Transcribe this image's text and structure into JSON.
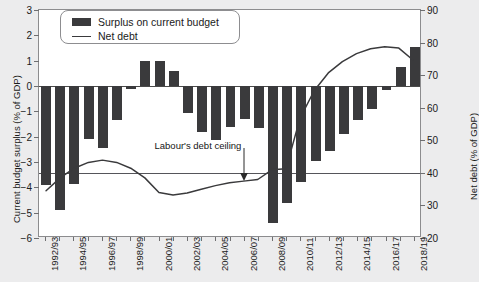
{
  "chart_data": {
    "type": "bar",
    "title": "",
    "categories": [
      "1992/93",
      "1993/94",
      "1994/95",
      "1995/96",
      "1996/97",
      "1997/98",
      "1998/99",
      "1999/00",
      "2000/01",
      "2001/02",
      "2002/03",
      "2003/04",
      "2004/05",
      "2005/06",
      "2006/07",
      "2007/08",
      "2008/09",
      "2009/10",
      "2010/11",
      "2011/12",
      "2012/13",
      "2013/14",
      "2014/15",
      "2015/16",
      "2016/17",
      "2017/18",
      "2018/19"
    ],
    "tick_labels": [
      "1992/93",
      "1994/95",
      "1996/97",
      "1998/99",
      "2000/01",
      "2002/03",
      "2004/05",
      "2006/07",
      "2008/09",
      "2010/11",
      "2012/13",
      "2014/15",
      "2016/17",
      "2018/19"
    ],
    "series": [
      {
        "name": "Surplus on current budget",
        "type": "bar",
        "axis": "left",
        "color": "#3a3a3c",
        "values": [
          -3.9,
          -4.9,
          -3.85,
          -2.1,
          -2.45,
          -1.35,
          -0.1,
          1.0,
          1.0,
          0.6,
          -1.05,
          -1.8,
          -2.15,
          -1.6,
          -1.3,
          -1.65,
          -5.4,
          -4.6,
          -3.8,
          -2.95,
          -2.55,
          -1.9,
          -1.35,
          -0.9,
          -0.15,
          0.75,
          1.55
        ]
      },
      {
        "name": "Net debt",
        "type": "line",
        "axis": "right",
        "color": "#3a3a3c",
        "values": [
          34.0,
          38.0,
          41.0,
          42.8,
          43.5,
          42.8,
          41.0,
          38.0,
          33.5,
          32.7,
          33.3,
          34.5,
          35.6,
          36.5,
          37.0,
          37.5,
          40.5,
          40.8,
          56.5,
          65.0,
          70.5,
          74.0,
          76.5,
          78.0,
          78.6,
          78.2,
          74.5
        ]
      }
    ],
    "ceiling_line": {
      "label": "Labour's debt ceiling",
      "value": 40.0,
      "axis": "right"
    },
    "left_axis": {
      "label": "Current budget surplus (% of GDP)",
      "ticks": [
        3,
        2,
        1,
        0,
        -1,
        -2,
        -3,
        -4,
        -5,
        -6
      ],
      "tick_labels": [
        "3",
        "2",
        "1",
        "0",
        "−1",
        "−2",
        "−3",
        "−4",
        "−5",
        "−6"
      ],
      "min": -6,
      "max": 3
    },
    "right_axis": {
      "label": "Net debt (% of GDP)",
      "ticks": [
        90,
        80,
        70,
        60,
        50,
        40,
        30,
        20
      ],
      "tick_labels": [
        "90",
        "80",
        "70",
        "60",
        "50",
        "40",
        "30",
        "20"
      ],
      "min": 20,
      "max": 90
    },
    "legend": {
      "position": "top-left",
      "entries": [
        {
          "label": "Surplus on current budget",
          "marker": "bar"
        },
        {
          "label": "Net debt",
          "marker": "line"
        }
      ]
    },
    "grid": false
  },
  "colors": {
    "bar": "#3a3a3c",
    "line": "#3a3a3c",
    "axis": "#6f6f71",
    "plot_background": "#ffffff",
    "page_background": "#ececed"
  }
}
